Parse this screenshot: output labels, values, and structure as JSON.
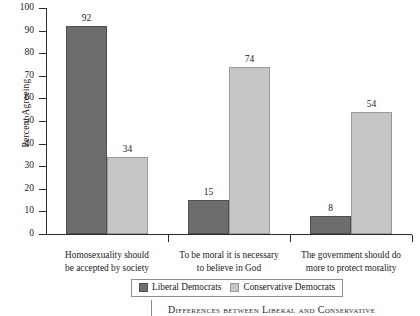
{
  "chart_data": {
    "type": "bar",
    "title": "",
    "xlabel": "",
    "ylabel": "Percent Agreeing",
    "ylim": [
      0,
      100
    ],
    "ytick_values": [
      0,
      10,
      20,
      30,
      40,
      50,
      60,
      70,
      80,
      90,
      100
    ],
    "grid": false,
    "legend_position": "bottom-center",
    "categories": [
      {
        "line1": "Homosexuality should",
        "line2": "be accepted by society"
      },
      {
        "line1": "To be moral it is necessary",
        "line2": "to believe in God"
      },
      {
        "line1": "The government should do",
        "line2": "more to protect morality"
      }
    ],
    "series": [
      {
        "name": "Liberal Democrats",
        "color": "#6d6d6d",
        "values": [
          92,
          15,
          8
        ]
      },
      {
        "name": "Conservative Democrats",
        "color": "#c6c6c6",
        "values": [
          34,
          74,
          54
        ]
      }
    ]
  },
  "caption": {
    "text": "Differences between Liberal and Conservative"
  }
}
